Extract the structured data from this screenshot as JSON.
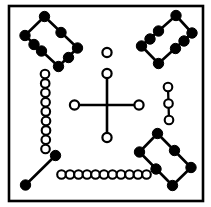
{
  "canvas": {
    "width": 211,
    "height": 207,
    "background": "#ffffff",
    "ink": "#000000"
  },
  "frame": {
    "label": "diagram-border",
    "x": 9,
    "y": 6,
    "width": 194,
    "height": 195,
    "stroke_width": 2.6,
    "stroke": "#000000",
    "fill": "#ffffff"
  },
  "legend": {
    "filled_node": "filled-black-node",
    "open_node": "open-white-node",
    "edge": "straight-line-segment"
  },
  "style": {
    "filled_radius": 5.2,
    "open_radius": 4.6,
    "open_stroke_width": 2.2,
    "edge_width": 2.6,
    "chain_radius": 4.3,
    "chain_stroke_width": 2.1,
    "chain_edge_width": 2.3
  },
  "clusters": [
    {
      "name": "top-left-rectangle",
      "kind": "closed-polygon",
      "node_style": "filled",
      "node_count": 8,
      "closed": true,
      "points": [
        [
          44,
          16
        ],
        [
          62,
          34
        ],
        [
          58,
          52
        ],
        [
          60,
          45
        ],
        [
          44,
          50
        ],
        [
          27,
          33
        ],
        [
          43,
          46
        ],
        [
          25,
          35
        ]
      ],
      "path": [
        [
          44,
          16
        ],
        [
          62,
          34
        ],
        [
          58,
          52
        ],
        [
          44,
          66
        ],
        [
          27,
          48
        ],
        [
          25,
          35
        ]
      ]
    },
    {
      "name": "top-right-rectangle",
      "kind": "closed-polygon",
      "node_style": "filled",
      "node_count": 8,
      "closed": true
    },
    {
      "name": "bottom-right-rectangle",
      "kind": "closed-polygon",
      "node_style": "filled",
      "node_count": 6,
      "closed": true
    },
    {
      "name": "bottom-left-segment",
      "kind": "line-segment",
      "node_style": "filled",
      "node_count": 2,
      "closed": false
    },
    {
      "name": "center-cross",
      "kind": "cross",
      "node_style": "open",
      "node_count": 4,
      "closed": false
    },
    {
      "name": "center-top-isolated-node",
      "kind": "isolated-node",
      "node_style": "open",
      "node_count": 1,
      "closed": false
    },
    {
      "name": "left-vertical-chain",
      "kind": "chain",
      "node_style": "open",
      "node_count": 9,
      "closed": false
    },
    {
      "name": "right-vertical-chain",
      "kind": "chain",
      "node_style": "open",
      "node_count": 3,
      "closed": false
    },
    {
      "name": "bottom-horizontal-chain",
      "kind": "chain",
      "node_style": "open",
      "node_count": 11,
      "closed": false
    }
  ],
  "geometry": {
    "top_left_rectangle": {
      "edges": [
        [
          [
            44.5,
            16.5
          ],
          [
            25.0,
            35.5
          ]
        ],
        [
          [
            25.0,
            35.5
          ],
          [
            58.5,
            66.5
          ]
        ],
        [
          [
            58.5,
            66.5
          ],
          [
            77.5,
            48.0
          ]
        ],
        [
          [
            77.5,
            48.0
          ],
          [
            44.5,
            16.5
          ]
        ]
      ],
      "nodes": [
        [
          44.5,
          16.5
        ],
        [
          25.0,
          35.5
        ],
        [
          41.5,
          51.0
        ],
        [
          58.5,
          66.5
        ],
        [
          77.5,
          48.0
        ],
        [
          61.0,
          32.5
        ],
        [
          34.0,
          44.5
        ],
        [
          68.5,
          57.5
        ]
      ]
    },
    "top_right_rectangle": {
      "edges": [
        [
          [
            176.0,
            15.5
          ],
          [
            192.0,
            33.0
          ]
        ],
        [
          [
            192.0,
            33.0
          ],
          [
            158.5,
            63.5
          ]
        ],
        [
          [
            158.5,
            63.5
          ],
          [
            141.5,
            46.0
          ]
        ],
        [
          [
            141.5,
            46.0
          ],
          [
            176.0,
            15.5
          ]
        ]
      ],
      "nodes": [
        [
          176.0,
          15.5
        ],
        [
          192.0,
          33.0
        ],
        [
          175.5,
          48.5
        ],
        [
          158.5,
          63.5
        ],
        [
          141.5,
          46.0
        ],
        [
          158.5,
          31.0
        ],
        [
          150.0,
          39.0
        ],
        [
          184.0,
          41.0
        ]
      ]
    },
    "bottom_right_rectangle": {
      "edges": [
        [
          [
            157.5,
            133.5
          ],
          [
            139.5,
            152.0
          ]
        ],
        [
          [
            139.5,
            152.0
          ],
          [
            172.5,
            185.5
          ]
        ],
        [
          [
            172.5,
            185.5
          ],
          [
            191.0,
            167.5
          ]
        ],
        [
          [
            191.0,
            167.5
          ],
          [
            157.5,
            133.5
          ]
        ]
      ],
      "nodes": [
        [
          157.5,
          133.5
        ],
        [
          139.5,
          152.0
        ],
        [
          172.5,
          185.5
        ],
        [
          191.0,
          167.5
        ],
        [
          156.0,
          169.0
        ],
        [
          174.5,
          150.5
        ]
      ]
    },
    "bottom_left_segment": {
      "edges": [
        [
          [
            55.5,
            155.5
          ],
          [
            25.5,
            185.0
          ]
        ]
      ],
      "nodes": [
        [
          55.5,
          155.5
        ],
        [
          25.5,
          185.0
        ]
      ]
    },
    "center_cross": {
      "center": [
        107.0,
        105.0
      ],
      "edges": [
        [
          [
            107.0,
            73.5
          ],
          [
            107.0,
            137.5
          ]
        ],
        [
          [
            74.5,
            105.0
          ],
          [
            139.0,
            105.0
          ]
        ]
      ],
      "nodes": [
        [
          107.0,
          73.5
        ],
        [
          107.0,
          137.5
        ],
        [
          74.5,
          105.0
        ],
        [
          139.0,
          105.0
        ]
      ]
    },
    "center_top_isolated_node": {
      "nodes": [
        [
          107.0,
          52.5
        ]
      ]
    },
    "left_vertical_chain": {
      "start": [
        45.5,
        74.0
      ],
      "end": [
        45.5,
        149.0
      ],
      "nodes": [
        [
          45.0,
          74.0
        ],
        [
          45.2,
          83.4
        ],
        [
          45.4,
          92.8
        ],
        [
          45.6,
          102.2
        ],
        [
          45.8,
          111.6
        ],
        [
          46.0,
          121.0
        ],
        [
          46.0,
          130.4
        ],
        [
          45.8,
          139.8
        ],
        [
          45.5,
          149.0
        ]
      ]
    },
    "right_vertical_chain": {
      "start": [
        168.5,
        87.0
      ],
      "end": [
        168.5,
        120.0
      ],
      "nodes": [
        [
          168.0,
          87.0
        ],
        [
          168.5,
          103.5
        ],
        [
          169.0,
          120.0
        ]
      ]
    },
    "bottom_horizontal_chain": {
      "start": [
        61.5,
        174.5
      ],
      "end": [
        146.5,
        174.5
      ],
      "nodes": [
        [
          61.5,
          174.5
        ],
        [
          70.0,
          174.5
        ],
        [
          78.5,
          174.5
        ],
        [
          87.0,
          174.5
        ],
        [
          95.5,
          174.5
        ],
        [
          104.0,
          174.5
        ],
        [
          112.5,
          174.5
        ],
        [
          121.0,
          174.5
        ],
        [
          129.5,
          174.5
        ],
        [
          138.0,
          174.5
        ],
        [
          146.5,
          174.5
        ]
      ]
    }
  }
}
